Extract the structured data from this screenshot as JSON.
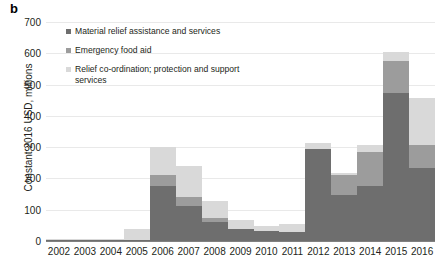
{
  "panel": {
    "letter": "b"
  },
  "axes": {
    "ylabel": "Constant 2016 USD, millions",
    "yticks": [
      0,
      100,
      200,
      300,
      400,
      500,
      600,
      700
    ],
    "ylim": [
      0,
      700
    ],
    "xlabel": ""
  },
  "legend": {
    "position": "upper-left-inside",
    "items": [
      {
        "label": "Material relief assistance and services",
        "color": "#6e6e6e",
        "key": "material"
      },
      {
        "label": "Emergency food aid",
        "color": "#9c9c9c",
        "key": "food"
      },
      {
        "label": "Relief co-ordination; protection and support services",
        "color": "#d9d9d9",
        "key": "relief"
      }
    ]
  },
  "chart_data": {
    "type": "bar",
    "stacked": true,
    "title": "",
    "xlabel": "",
    "ylabel": "Constant 2016 USD, millions",
    "ylim": [
      0,
      700
    ],
    "yticks": [
      0,
      100,
      200,
      300,
      400,
      500,
      600,
      700
    ],
    "grid": true,
    "categories": [
      "2002",
      "2003",
      "2004",
      "2005",
      "2006",
      "2007",
      "2008",
      "2009",
      "2010",
      "2011",
      "2012",
      "2013",
      "2014",
      "2015",
      "2016"
    ],
    "series": [
      {
        "name": "Material relief assistance and services",
        "color": "#6e6e6e",
        "values": [
          2,
          3,
          1,
          2,
          177,
          112,
          62,
          38,
          31,
          30,
          293,
          148,
          177,
          472,
          232
        ]
      },
      {
        "name": "Emergency food aid",
        "color": "#9c9c9c",
        "values": [
          0,
          0,
          0,
          0,
          33,
          30,
          11,
          0,
          0,
          0,
          0,
          62,
          106,
          103,
          76
        ]
      },
      {
        "name": "Relief co-ordination; protection and support services",
        "color": "#d9d9d9",
        "values": [
          2,
          2,
          1,
          35,
          91,
          97,
          54,
          29,
          17,
          24,
          19,
          6,
          24,
          28,
          150
        ]
      }
    ],
    "totals": [
      4,
      5,
      2,
      37,
      301,
      239,
      127,
      67,
      48,
      54,
      312,
      216,
      307,
      603,
      458
    ]
  }
}
